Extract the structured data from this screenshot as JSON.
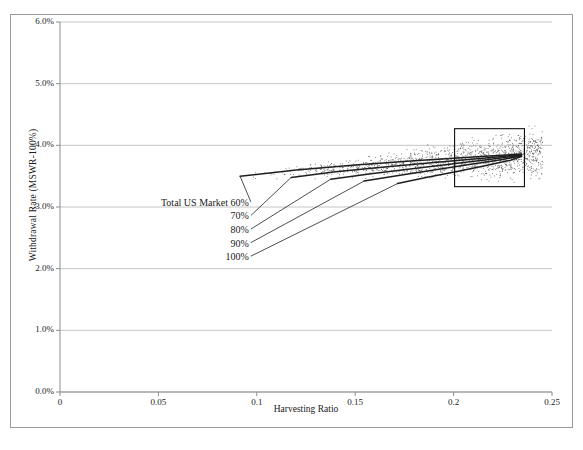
{
  "chart_data": {
    "type": "scatter",
    "title": "",
    "xlabel": "Harvesting Ratio",
    "ylabel": "Withdrawal Rate (MSWR-100%)",
    "xlim": [
      0,
      0.25
    ],
    "ylim": [
      0,
      0.06
    ],
    "xticks": [
      0,
      0.05,
      0.1,
      0.15,
      0.2,
      0.25
    ],
    "xticklabels": [
      "0",
      "0.05",
      "0.1",
      "0.15",
      "0.2",
      "0.25"
    ],
    "yticks": [
      0,
      0.01,
      0.02,
      0.03,
      0.04,
      0.05,
      0.06
    ],
    "yticklabels": [
      "0.0%",
      "1.0%",
      "2.0%",
      "3.0%",
      "4.0%",
      "5.0%",
      "6.0%"
    ],
    "grid": "horizontal",
    "legend_position": "inline-annotations",
    "annotations": [
      {
        "label": "Total US Market 60%",
        "text_x": 0.0665,
        "text_y": 0.0305,
        "point_x": 0.0915,
        "point_y": 0.035
      },
      {
        "label": "70%",
        "text_x": 0.0665,
        "text_y": 0.0283,
        "point_x": 0.1175,
        "point_y": 0.0348
      },
      {
        "label": "80%",
        "text_x": 0.0665,
        "text_y": 0.0261,
        "point_x": 0.1375,
        "point_y": 0.0345
      },
      {
        "label": "90%",
        "text_x": 0.0665,
        "text_y": 0.0239,
        "point_x": 0.1545,
        "point_y": 0.0342
      },
      {
        "label": "100%",
        "text_x": 0.0665,
        "text_y": 0.0217,
        "point_x": 0.1715,
        "point_y": 0.0338
      }
    ],
    "highlight_box": {
      "x0": 0.2005,
      "y0": 0.0333,
      "x1": 0.236,
      "y1": 0.0427
    },
    "series": [
      {
        "name": "Total US Market 60%",
        "x": [
          0.0915,
          0.12,
          0.15,
          0.18,
          0.21,
          0.2345
        ],
        "y": [
          0.035,
          0.036,
          0.0368,
          0.0375,
          0.0381,
          0.0386
        ]
      },
      {
        "name": "70%",
        "x": [
          0.1175,
          0.14,
          0.165,
          0.19,
          0.215,
          0.2345
        ],
        "y": [
          0.0348,
          0.0357,
          0.0365,
          0.0372,
          0.0379,
          0.0385
        ]
      },
      {
        "name": "80%",
        "x": [
          0.1375,
          0.158,
          0.179,
          0.2,
          0.22,
          0.2345
        ],
        "y": [
          0.0345,
          0.0354,
          0.0362,
          0.037,
          0.0378,
          0.0384
        ]
      },
      {
        "name": "90%",
        "x": [
          0.1545,
          0.172,
          0.19,
          0.208,
          0.225,
          0.2345
        ],
        "y": [
          0.0342,
          0.0351,
          0.036,
          0.0369,
          0.0377,
          0.0383
        ]
      },
      {
        "name": "100%",
        "x": [
          0.1715,
          0.186,
          0.201,
          0.216,
          0.229,
          0.2345
        ],
        "y": [
          0.0338,
          0.0348,
          0.0357,
          0.0367,
          0.0376,
          0.0382
        ]
      }
    ],
    "scatter": {
      "description": "Dense cloud of simulation outcome points between roughly 3.2% and 4.3% withdrawal rate spanning harvesting ratios 0.095 to 0.245",
      "x_range": [
        0.095,
        0.245
      ],
      "y_range": [
        0.0318,
        0.0432
      ],
      "n_points": 1400,
      "color": "#2b2b2b"
    },
    "colors": {
      "line": "#1f1f1f",
      "grid": "#b6b6b6",
      "axis": "#8c8c8c",
      "text": "#1a1a1a",
      "box": "#111111"
    }
  }
}
